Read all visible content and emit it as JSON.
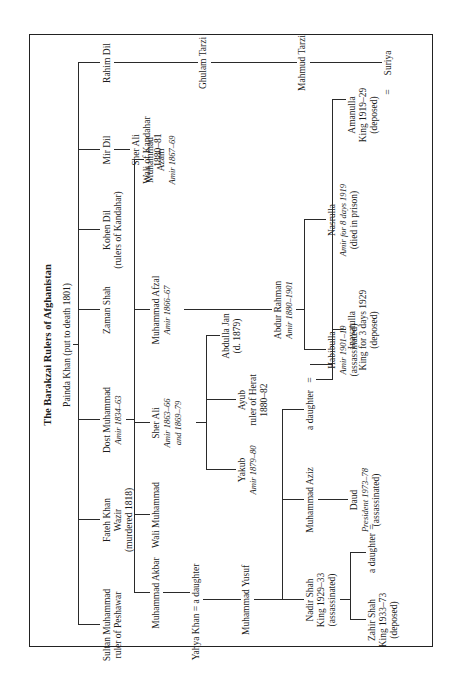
{
  "title": "The Barakzai Rulers of Afghanistan",
  "root": {
    "name": "Painda Khan",
    "note": "(put to death 1801)"
  },
  "gen1": [
    {
      "name": "Sultan Muhammad",
      "l2": "ruler of Peshawar"
    },
    {
      "name": "Fateh Khan",
      "l2": "Wazir",
      "l3": "(murdered 1818)"
    },
    {
      "name": "Dost Muhammad",
      "l2": "Amir 1834–63"
    },
    {
      "name": "Zaman Shah"
    },
    {
      "name": "Kohen Dil",
      "l2": "(rulers of Kandahar)"
    },
    {
      "name": "Mir Dil"
    },
    {
      "name": "Rahim Dil"
    }
  ],
  "sher_ali_kandahar": {
    "name": "Sher Ali",
    "l2": "Wali of Kandahar",
    "l3": "1880–81"
  },
  "ghulam_tarzi": "Ghulam Tarzi",
  "mahmud_tarzi": "Mahmud Tarzi",
  "suriya": "Suriya",
  "gen2": [
    {
      "name": "Muhammad Akbar"
    },
    {
      "name": "Wali Muhammad"
    },
    {
      "name": "Sher Ali",
      "l2": "Amir 1863–66",
      "l3": "and 1869–79"
    },
    {
      "name": "Muhammad Afzal",
      "l2": "Amir 1866–67"
    },
    {
      "name": "Muhammad",
      "l2": "Azam",
      "l3": "Amir 1867–69"
    }
  ],
  "yahya": {
    "name": "Yahya Khan",
    "eq": "=",
    "spouse": "a daughter"
  },
  "sher_ali_sons": [
    {
      "name": "Yakub",
      "l2": "Amir 1879–80"
    },
    {
      "name": "Ayub",
      "l2": "ruler of Herat",
      "l3": "1880–82"
    },
    {
      "name": "Abdulla Jan",
      "l2": "(d. 1879)"
    }
  ],
  "abdur_rahman": {
    "name": "Abdur Rahman",
    "l2": "Amir 1880–1901"
  },
  "muhammad_yusuf": "Muhammad Yusuf",
  "habibulla": {
    "name": "Habibulla",
    "l2": "Amir 1901–19",
    "l3": "(assassinated)"
  },
  "nasrulla": {
    "name": "Nasrulla",
    "l2": "Amir for 8 days 1919",
    "l3": "(died in prison)"
  },
  "yusuf_children": [
    {
      "name": "Nadir Shah",
      "l2": "King 1929–33",
      "l3": "(assassinated)"
    },
    {
      "name": "Muhammad Aziz"
    },
    {
      "name": "a daughter"
    }
  ],
  "habibulla_children": [
    {
      "name": "Inayatulla",
      "l2": "King for 3 days 1929",
      "l3": "(deposed)"
    },
    {
      "name": "Amanulla",
      "l2": "King 1919–29",
      "l3": "(deposed)"
    }
  ],
  "gen5": [
    {
      "name": "Zahir Shah",
      "l2": "King 1933–73",
      "l3": "(deposed)"
    },
    {
      "name": "a daughter"
    },
    {
      "name": "Daud",
      "l2": "President 1973–78",
      "l3": "(assassinated)"
    }
  ],
  "eq_sign": "="
}
